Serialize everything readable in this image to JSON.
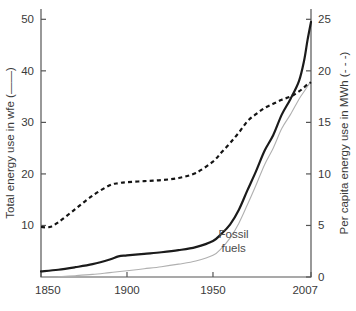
{
  "chart_data": {
    "type": "line",
    "title": "",
    "subtitle": "",
    "xlabel": "",
    "ylabel": "Total energy use in wfe (——)",
    "y2label": "Per capita energy use in MWh (- - -)",
    "xlim": [
      1850,
      2007
    ],
    "ylim": [
      0,
      52
    ],
    "y2lim": [
      0,
      26
    ],
    "grid": false,
    "legend_position": "none",
    "x_ticks": [
      "1850",
      "1900",
      "1950",
      "2007"
    ],
    "x_tick_values": [
      1850,
      1900,
      1950,
      2007
    ],
    "y_ticks": [
      "10",
      "20",
      "30",
      "40",
      "50"
    ],
    "y_tick_values": [
      10,
      20,
      30,
      40,
      50
    ],
    "y2_ticks": [
      "0",
      "5",
      "10",
      "15",
      "20",
      "25"
    ],
    "y2_tick_values": [
      0,
      5,
      10,
      15,
      20,
      25
    ],
    "annotations": [
      {
        "text_line1": "Fossil",
        "text_line2": "fuels",
        "x": 1962,
        "y": 7.5
      }
    ],
    "colors": {
      "total": "#1b1b1b",
      "fossil": "#b0b0b0",
      "per_capita": "#141414",
      "axis": "#555555",
      "background": "#ffffff",
      "text": "#3a3a3a"
    },
    "series": [
      {
        "name": "Total energy use",
        "axis": "left",
        "style": "solid",
        "units": "wfe",
        "x": [
          1850,
          1860,
          1870,
          1880,
          1890,
          1895,
          1900,
          1910,
          1920,
          1930,
          1940,
          1950,
          1955,
          1960,
          1965,
          1970,
          1975,
          1980,
          1985,
          1990,
          1995,
          2000,
          2003,
          2005,
          2007
        ],
        "values": [
          1.1,
          1.4,
          1.9,
          2.5,
          3.4,
          4.0,
          4.2,
          4.5,
          4.8,
          5.2,
          5.8,
          7.0,
          8.4,
          10.2,
          13.0,
          16.8,
          20.5,
          24.5,
          27.5,
          31.5,
          34.5,
          38.0,
          42.0,
          46.0,
          49.5
        ]
      },
      {
        "name": "Fossil fuels",
        "axis": "left",
        "style": "solid-thin",
        "units": "wfe",
        "x": [
          1860,
          1870,
          1880,
          1890,
          1900,
          1910,
          1920,
          1930,
          1940,
          1950,
          1955,
          1960,
          1965,
          1970,
          1975,
          1980,
          1985,
          1990,
          1995,
          2000,
          2003,
          2005,
          2007
        ],
        "values": [
          0.05,
          0.25,
          0.5,
          0.85,
          1.2,
          1.6,
          2.0,
          2.5,
          3.1,
          4.2,
          5.6,
          7.6,
          10.4,
          14.0,
          17.8,
          21.8,
          25.0,
          28.8,
          31.5,
          34.5,
          36.0,
          37.0,
          38.0
        ]
      },
      {
        "name": "Per capita energy use",
        "axis": "right",
        "style": "dashed",
        "units": "MWh",
        "x": [
          1850,
          1855,
          1860,
          1870,
          1880,
          1890,
          1895,
          1900,
          1910,
          1920,
          1930,
          1940,
          1950,
          1955,
          1960,
          1965,
          1970,
          1975,
          1980,
          1985,
          1990,
          1995,
          2000,
          2003,
          2005,
          2007
        ],
        "values": [
          4.85,
          4.85,
          5.3,
          6.6,
          7.9,
          8.9,
          9.1,
          9.2,
          9.3,
          9.4,
          9.6,
          10.1,
          11.2,
          12.1,
          13.0,
          14.0,
          15.1,
          15.8,
          16.4,
          16.8,
          17.2,
          17.5,
          18.0,
          18.4,
          18.7,
          18.9
        ]
      }
    ]
  }
}
